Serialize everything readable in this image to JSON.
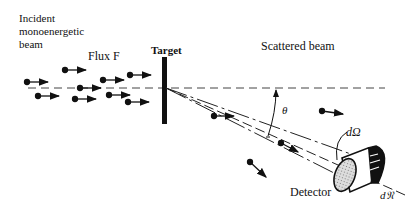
{
  "labels": {
    "incident_beam": "Incident\nmonoenergetic\nbeam",
    "flux": "Flux F",
    "target": "Target",
    "scattered_beam": "Scattered beam",
    "theta": "θ",
    "solid_angle": "dΩ",
    "detector": "Detector",
    "count": "d𝔑"
  }
}
